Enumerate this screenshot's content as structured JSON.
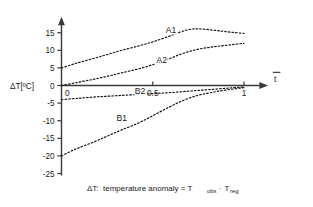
{
  "figure": {
    "background_color": "#ffffff",
    "axis_color": "#3a3a3a",
    "curve_color": "#111111"
  },
  "axes": {
    "y_title": "ΔT[ºC]",
    "x_title": "t",
    "x_title_has_overbar": true,
    "y_ticks": [
      "15",
      "10",
      "5",
      "0",
      "-5",
      "-10",
      "-15",
      "-20",
      "-25"
    ],
    "x_ticks": [
      "0",
      "0.5",
      "1"
    ],
    "arrow_x": "x-axis-arrow",
    "arrow_y": "y-axis-arrow"
  },
  "caption": {
    "symbol": "ΔT:",
    "text": "temperature anomaly = T",
    "sub1": "obs",
    "operator": "·",
    "term2": "T",
    "sub2": "reg",
    "full": "ΔT:  temperature anomaly = T_obs · T_reg"
  },
  "chart_data": {
    "type": "line",
    "title": "",
    "xlabel": "t̄",
    "ylabel": "ΔT[ºC]",
    "xlim": [
      0,
      1
    ],
    "ylim": [
      -25,
      15
    ],
    "grid": false,
    "legend": "inline-curve-labels",
    "x_ticks": [
      0,
      0.5,
      1
    ],
    "y_ticks": [
      15,
      10,
      5,
      0,
      -5,
      -10,
      -15,
      -20,
      -25
    ],
    "linestyle": "dotted",
    "series": [
      {
        "name": "A1",
        "label": "A1",
        "label_x": 0.6,
        "label_y": 15.0,
        "x": [
          0.0,
          0.08,
          0.17,
          0.25,
          0.33,
          0.42,
          0.5,
          0.58,
          0.64,
          0.7,
          0.75,
          0.82,
          0.9,
          1.0
        ],
        "y": [
          5.0,
          6.3,
          7.6,
          8.8,
          10.0,
          11.2,
          12.4,
          13.8,
          15.0,
          15.9,
          16.1,
          15.8,
          15.3,
          14.8
        ]
      },
      {
        "name": "A2",
        "label": "A2",
        "label_x": 0.55,
        "label_y": 6.3,
        "x": [
          0.0,
          0.08,
          0.17,
          0.25,
          0.33,
          0.42,
          0.5,
          0.58,
          0.66,
          0.74,
          0.82,
          0.9,
          1.0
        ],
        "y": [
          0.0,
          0.8,
          1.7,
          2.6,
          3.6,
          4.7,
          5.9,
          7.4,
          9.0,
          10.2,
          10.9,
          11.4,
          12.0
        ]
      },
      {
        "name": "B2",
        "label": "B2",
        "label_x": 0.43,
        "label_y": -2.4,
        "x": [
          0.0,
          0.1,
          0.2,
          0.3,
          0.4,
          0.5,
          0.6,
          0.7,
          0.8,
          0.9,
          1.0
        ],
        "y": [
          -4.0,
          -3.6,
          -3.2,
          -2.9,
          -2.6,
          -2.3,
          -2.0,
          -1.6,
          -1.2,
          -0.8,
          -0.4
        ]
      },
      {
        "name": "B1",
        "label": "B1",
        "label_x": 0.33,
        "label_y": -10.0,
        "x": [
          0.0,
          0.08,
          0.17,
          0.25,
          0.33,
          0.42,
          0.5,
          0.58,
          0.66,
          0.74,
          0.82,
          0.9,
          1.0
        ],
        "y": [
          -20.0,
          -18.0,
          -16.2,
          -14.4,
          -12.6,
          -10.7,
          -8.6,
          -6.4,
          -4.4,
          -2.9,
          -2.0,
          -1.3,
          -0.6
        ]
      }
    ]
  }
}
